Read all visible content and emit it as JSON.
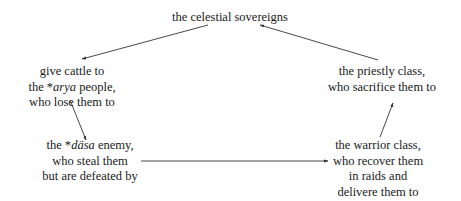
{
  "diagram": {
    "nodes": {
      "sovereigns": {
        "lines": [
          "the celestial sovereigns"
        ]
      },
      "arya": {
        "line1": "give cattle to",
        "line2_prefix": "the *",
        "line2_italic": "arya",
        "line2_suffix": " people,",
        "line3": "who lose them to"
      },
      "dasa": {
        "line1_prefix": "the *",
        "line1_italic": "dāsa",
        "line1_suffix": " enemy,",
        "line2": "who steal them",
        "line3": "but are defeated by"
      },
      "warrior": {
        "line1": "the warrior class,",
        "line2": "who recover them",
        "line3": "in raids and",
        "line4": "delivere them to"
      },
      "priestly": {
        "line1": "the priestly class,",
        "line2": "who sacrifice them to"
      }
    },
    "edges": [
      {
        "from": "sovereigns",
        "to": "arya"
      },
      {
        "from": "arya",
        "to": "dasa"
      },
      {
        "from": "dasa",
        "to": "warrior"
      },
      {
        "from": "warrior",
        "to": "priestly"
      },
      {
        "from": "priestly",
        "to": "sovereigns"
      }
    ],
    "colors": {
      "text": "#1a1a1a",
      "arrow": "#333333",
      "background": "#ffffff"
    }
  }
}
